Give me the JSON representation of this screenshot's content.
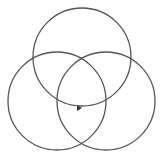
{
  "diagram": {
    "type": "venn",
    "background": "#ffffff",
    "stroke_color": "#555555",
    "stroke_width": 1.3,
    "circles": [
      {
        "name": "top",
        "cx": 82,
        "cy": 57,
        "r": 49
      },
      {
        "name": "left",
        "cx": 57,
        "cy": 101,
        "r": 49
      },
      {
        "name": "right",
        "cx": 106,
        "cy": 101,
        "r": 49
      }
    ],
    "arrow": {
      "x": 79,
      "y": 108,
      "direction": "right",
      "color": "#333333"
    }
  }
}
